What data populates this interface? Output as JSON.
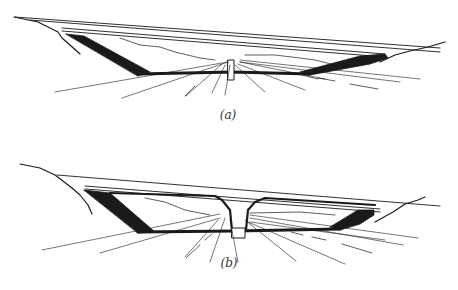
{
  "figure": {
    "width": 458,
    "height": 290,
    "background": "#ffffff",
    "ink": "#1a1a1a",
    "panels": [
      {
        "id": "a",
        "caption": "(a)",
        "caption_pos": [
          228,
          108
        ],
        "deck_lines": [
          [
            [
              15,
              17
            ],
            [
              440,
              48
            ]
          ],
          [
            [
              30,
              20
            ],
            [
              440,
              52
            ]
          ],
          [
            [
              62,
              28
            ],
            [
              385,
              54
            ]
          ],
          [
            [
              62,
              31
            ],
            [
              385,
              57
            ]
          ]
        ],
        "left_bank": [
          [
            14,
            17
          ],
          [
            38,
            22
          ],
          [
            48,
            27
          ],
          [
            58,
            32
          ],
          [
            62,
            38
          ],
          [
            70,
            45
          ],
          [
            80,
            54
          ]
        ],
        "right_bank": [
          [
            380,
            62
          ],
          [
            395,
            55
          ],
          [
            410,
            51
          ],
          [
            428,
            47
          ],
          [
            445,
            42
          ]
        ],
        "inner_lines": [
          [
            [
              120,
              38
            ],
            [
              140,
              45
            ],
            [
              160,
              47
            ],
            [
              175,
              52
            ],
            [
              200,
              58
            ],
            [
              215,
              60
            ]
          ],
          [
            [
              245,
              55
            ],
            [
              275,
              55
            ],
            [
              300,
              58
            ],
            [
              315,
              60
            ],
            [
              335,
              65
            ]
          ]
        ],
        "dark_struts": [
          [
            [
              66,
              34
            ],
            [
              84,
              36
            ],
            [
              150,
              72
            ],
            [
              138,
              76
            ]
          ],
          [
            [
              300,
              72
            ],
            [
              360,
              56
            ],
            [
              385,
              54
            ],
            [
              388,
              58
            ],
            [
              370,
              64
            ],
            [
              310,
              75
            ]
          ]
        ],
        "lower_chord": [
          [
            138,
            74
          ],
          [
            232,
            72
          ],
          [
            310,
            74
          ]
        ],
        "pier": [
          [
            228,
            60
          ],
          [
            234,
            60
          ],
          [
            234,
            80
          ],
          [
            228,
            80
          ]
        ],
        "rays": [
          [
            [
              228,
              62
            ],
            [
              55,
              92
            ]
          ],
          [
            [
              228,
              62
            ],
            [
              122,
              98
            ]
          ],
          [
            [
              222,
              64
            ],
            [
              186,
              96
            ]
          ],
          [
            [
              225,
              65
            ],
            [
              212,
              93
            ]
          ],
          [
            [
              230,
              65
            ],
            [
              225,
              95
            ]
          ],
          [
            [
              235,
              65
            ],
            [
              265,
              92
            ]
          ],
          [
            [
              238,
              64
            ],
            [
              305,
              90
            ]
          ],
          [
            [
              240,
              62
            ],
            [
              325,
              79
            ]
          ],
          [
            [
              240,
              60
            ],
            [
              420,
              79
            ]
          ],
          [
            [
              240,
              62
            ],
            [
              400,
              82
            ]
          ]
        ],
        "dashes": [
          [
            [
              185,
              96
            ],
            [
              195,
              86
            ]
          ],
          [
            [
              298,
              74
            ],
            [
              318,
              79
            ]
          ],
          [
            [
              318,
              78
            ],
            [
              335,
              81
            ]
          ],
          [
            [
              350,
              84
            ],
            [
              378,
              89
            ]
          ]
        ]
      },
      {
        "id": "b",
        "caption": "(b)",
        "caption_pos": [
          229,
          256
        ],
        "deck_lines": [
          [
            [
              57,
              175
            ],
            [
              440,
              206
            ]
          ],
          [
            [
              85,
              186
            ],
            [
              380,
              209
            ]
          ],
          [
            [
              85,
              189
            ],
            [
              380,
              212
            ]
          ]
        ],
        "left_bank": [
          [
            20,
            164
          ],
          [
            40,
            168
          ],
          [
            55,
            175
          ],
          [
            72,
            188
          ],
          [
            80,
            195
          ],
          [
            88,
            205
          ],
          [
            92,
            214
          ]
        ],
        "right_bank": [
          [
            375,
            222
          ],
          [
            393,
            212
          ],
          [
            405,
            204
          ],
          [
            418,
            200
          ],
          [
            425,
            197
          ]
        ],
        "inner_lines": [
          [
            [
              145,
              198
            ],
            [
              165,
              202
            ],
            [
              185,
              210
            ],
            [
              210,
              215
            ]
          ],
          [
            [
              250,
              213
            ],
            [
              300,
              212
            ],
            [
              335,
              215
            ]
          ]
        ],
        "dark_struts": [
          [
            [
              84,
              190
            ],
            [
              110,
              193
            ],
            [
              155,
              232
            ],
            [
              138,
              233
            ]
          ],
          [
            [
              330,
              227
            ],
            [
              358,
              210
            ],
            [
              374,
              210
            ],
            [
              374,
              215
            ],
            [
              360,
              224
            ],
            [
              340,
              230
            ]
          ]
        ],
        "top_chord_left": [
          [
            110,
            193
          ],
          [
            215,
            196
          ],
          [
            222,
            200
          ],
          [
            230,
            210
          ],
          [
            232,
            230
          ]
        ],
        "top_chord_right": [
          [
            246,
            230
          ],
          [
            248,
            210
          ],
          [
            255,
            202
          ],
          [
            265,
            198
          ],
          [
            375,
            205
          ]
        ],
        "lower_chord": [
          [
            138,
            232
          ],
          [
            235,
            231
          ],
          [
            340,
            229
          ]
        ],
        "pier": [
          [
            232,
            228
          ],
          [
            245,
            228
          ],
          [
            245,
            238
          ],
          [
            232,
            238
          ]
        ],
        "rays": [
          [
            [
              220,
              214
            ],
            [
              42,
              250
            ]
          ],
          [
            [
              220,
              218
            ],
            [
              100,
              253
            ]
          ],
          [
            [
              218,
              220
            ],
            [
              185,
              257
            ]
          ],
          [
            [
              225,
              218
            ],
            [
              210,
              262
            ]
          ],
          [
            [
              230,
              220
            ],
            [
              238,
              262
            ]
          ],
          [
            [
              245,
              220
            ],
            [
              296,
              261
            ]
          ],
          [
            [
              248,
              222
            ],
            [
              345,
              264
            ]
          ],
          [
            [
              250,
              215
            ],
            [
              418,
              238
            ]
          ],
          [
            [
              250,
              218
            ],
            [
              403,
              245
            ]
          ],
          [
            [
              250,
              222
            ],
            [
              385,
              240
            ]
          ]
        ],
        "dashes": [
          [
            [
              186,
              258
            ],
            [
              200,
              245
            ]
          ],
          [
            [
              205,
              240
            ],
            [
              212,
              234
            ]
          ],
          [
            [
              291,
              232
            ],
            [
              303,
              235
            ]
          ],
          [
            [
              312,
              237
            ],
            [
              326,
              240
            ]
          ],
          [
            [
              342,
              244
            ],
            [
              372,
              253
            ]
          ]
        ]
      }
    ]
  }
}
